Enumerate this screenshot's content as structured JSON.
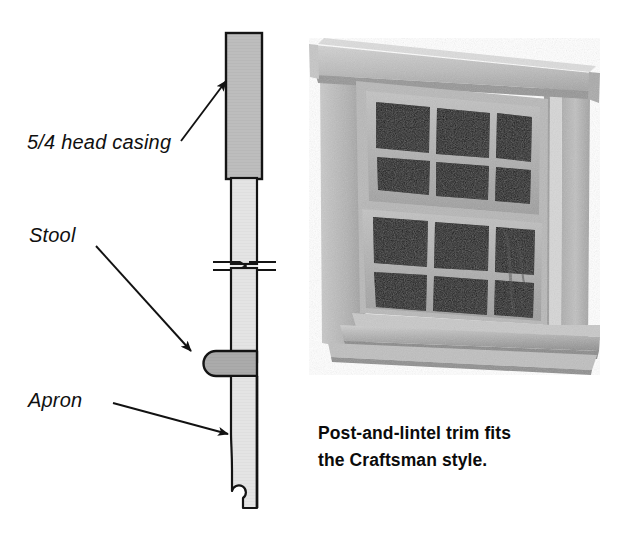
{
  "figure": {
    "type": "technical-illustration",
    "background_color": "#ffffff"
  },
  "section_drawing": {
    "title": "window-trim-section",
    "callouts": [
      {
        "id": "head-casing",
        "label": "5/4 head casing",
        "style": "italic",
        "arrow": {
          "from_x": 181,
          "from_y": 141,
          "to_x": 229,
          "to_y": 79
        }
      },
      {
        "id": "stool",
        "label": "Stool",
        "style": "italic",
        "arrow": {
          "from_x": 96,
          "from_y": 246,
          "to_x": 196,
          "to_y": 356
        }
      },
      {
        "id": "apron",
        "label": "Apron",
        "style": "italic",
        "arrow": {
          "from_x": 113,
          "from_y": 403,
          "to_x": 233,
          "to_y": 435
        }
      }
    ],
    "parts": [
      {
        "id": "head-casing-block",
        "name": "5/4 head casing",
        "fill": "#bcbcbc",
        "stroke": "#141414"
      },
      {
        "id": "jamb-casing-upper",
        "name": "casing above break",
        "fill": "#e2e2e2",
        "stroke": "#141414"
      },
      {
        "id": "jamb-casing-lower",
        "name": "casing below break",
        "fill": "#e2e2e2",
        "stroke": "#141414"
      },
      {
        "id": "stool-block",
        "name": "Stool",
        "fill": "#a9a9a9",
        "stroke": "#141414"
      },
      {
        "id": "apron-block",
        "name": "Apron",
        "fill": "#e6e6e6",
        "stroke": "#141414"
      },
      {
        "id": "break-symbol",
        "name": "break symbol",
        "stroke": "#141414"
      }
    ],
    "colors": {
      "line": "#141414",
      "head_casing_fill": "#bcbcbc",
      "casing_fill": "#e2e2e2",
      "stool_fill": "#a9a9a9",
      "apron_fill": "#e6e6e6"
    }
  },
  "photo": {
    "id": "window-photo",
    "alt": "Photograph of a double-hung window with post-and-lintel Craftsman trim",
    "palette": {
      "lintel_top": "#c9c9c9",
      "lintel_face": "#b4b4b4",
      "lintel_shadow": "#9a9a9a",
      "casing_light": "#c2c2c2",
      "casing_mid": "#aeaeae",
      "casing_dark": "#8f8f8f",
      "sash_light": "#bdbdbd",
      "sash_mid": "#a5a5a5",
      "muntin": "#a0a0a0",
      "glass_dark": "#141414",
      "glass_mid": "#1d1d1d",
      "sill_light": "#c4c4c4",
      "sill_dark": "#8a8a8a",
      "jamb_highlight": "#d8d8d8"
    },
    "window": {
      "type": "double-hung",
      "lites_per_sash": 6,
      "grid_rows": 2,
      "grid_cols": 3,
      "sashes": 2
    }
  },
  "caption": {
    "line1": "Post-and-lintel trim fits",
    "line2": "the Craftsman style.",
    "full_text": "Post-and-lintel trim fits the Craftsman style.",
    "weight": "bold"
  }
}
